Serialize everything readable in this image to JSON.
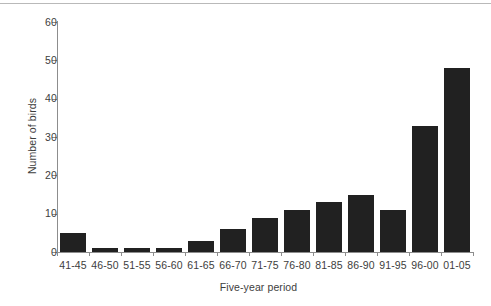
{
  "figure": {
    "background_color": "#ffffff",
    "bar_color": "#212121",
    "axis_color": "#8d8d8d",
    "text_color": "#3d3d3d",
    "top_rule_color": "#b9b9b9"
  },
  "chart_data": {
    "type": "bar",
    "title": "",
    "xlabel": "Five-year period",
    "ylabel": "Number of birds",
    "categories": [
      "41-45",
      "46-50",
      "51-55",
      "56-60",
      "61-65",
      "66-70",
      "71-75",
      "76-80",
      "81-85",
      "86-90",
      "91-95",
      "96-00",
      "01-05"
    ],
    "values": [
      5,
      1,
      1,
      1,
      3,
      6,
      9,
      11,
      13,
      15,
      11,
      33,
      48
    ],
    "ylim": [
      0,
      60
    ],
    "yticks": [
      0,
      10,
      20,
      30,
      40,
      50,
      60
    ],
    "ytick_labels": [
      "0",
      "10",
      "20",
      "30",
      "40",
      "50",
      "60"
    ],
    "grid": false,
    "legend": null
  }
}
